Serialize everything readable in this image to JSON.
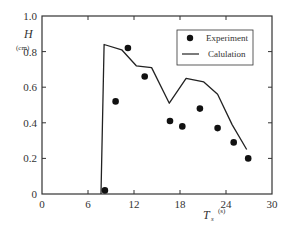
{
  "chart_data": {
    "type": "scatter+line",
    "title": "",
    "xlabel": "T_s",
    "xlabel_main": "T",
    "xlabel_sub": "s",
    "xunit": "(s)",
    "ylabel": "H",
    "yunit": "(cm)",
    "xlim": [
      0,
      30
    ],
    "ylim": [
      0,
      1.0
    ],
    "xticks": [
      0,
      6,
      12,
      18,
      24,
      30
    ],
    "yticks": [
      0,
      0.2,
      0.4,
      0.6,
      0.8,
      1.0
    ],
    "xtick_labels": [
      "0",
      "6",
      "12",
      "18",
      "24",
      "30"
    ],
    "ytick_labels": [
      "0",
      "0.2",
      "0.4",
      "0.6",
      "0.8",
      "1.0"
    ],
    "grid": false,
    "legend_position": "upper right",
    "series": [
      {
        "name": "Experiment",
        "kind": "scatter",
        "marker": "filled-circle",
        "x": [
          8.2,
          9.6,
          11.2,
          13.4,
          16.7,
          18.3,
          20.6,
          22.9,
          25.0,
          26.9
        ],
        "y": [
          0.02,
          0.52,
          0.82,
          0.66,
          0.41,
          0.38,
          0.48,
          0.37,
          0.29,
          0.2
        ]
      },
      {
        "name": "Calulation",
        "kind": "line",
        "x": [
          7.7,
          8.1,
          10.4,
          12.3,
          14.3,
          16.6,
          18.8,
          21.1,
          22.9,
          24.8,
          26.7
        ],
        "y": [
          0.0,
          0.84,
          0.81,
          0.72,
          0.71,
          0.51,
          0.65,
          0.63,
          0.56,
          0.39,
          0.25
        ]
      }
    ]
  },
  "legend": {
    "experiment_label": "Experiment",
    "calculation_label": "Calulation"
  },
  "colors": {
    "ink": "#222222",
    "background": "#ffffff"
  }
}
